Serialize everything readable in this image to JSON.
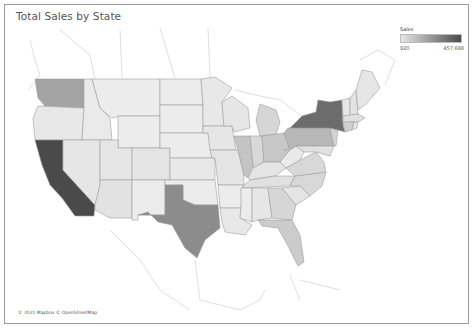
{
  "title": "Total Sales by State",
  "legend": {
    "title": "Sales",
    "min_label": "920",
    "max_label": "457,688",
    "min_color": "#e6e6e6",
    "max_color": "#4a4a4a"
  },
  "attribution": "© 2021 Mapbox © OpenStreetMap",
  "map": {
    "type": "choropleth",
    "measure": "Sales",
    "region": "United States",
    "highlighted_states": [
      {
        "state": "California",
        "shade": "darkest"
      },
      {
        "state": "New York",
        "shade": "dark"
      },
      {
        "state": "Texas",
        "shade": "medium-dark"
      },
      {
        "state": "Washington",
        "shade": "medium"
      },
      {
        "state": "Pennsylvania",
        "shade": "medium"
      },
      {
        "state": "Illinois",
        "shade": "medium-light"
      },
      {
        "state": "Ohio",
        "shade": "medium-light"
      },
      {
        "state": "Florida",
        "shade": "medium-light"
      },
      {
        "state": "Michigan",
        "shade": "light"
      },
      {
        "state": "Virginia",
        "shade": "light"
      },
      {
        "state": "North Carolina",
        "shade": "light"
      },
      {
        "state": "Georgia",
        "shade": "light"
      }
    ]
  }
}
